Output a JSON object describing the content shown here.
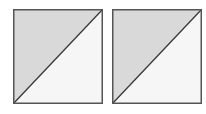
{
  "diagram": {
    "tiles": [
      {
        "name": "left-square",
        "x": 13,
        "upper_fill": "#d9d9d9",
        "lower_fill": "#f6f6f6",
        "border": "#555555"
      },
      {
        "name": "right-square",
        "x": 112,
        "upper_fill": "#d9d9d9",
        "lower_fill": "#f6f6f6",
        "border": "#555555"
      }
    ],
    "diagonal": "bottom-left to top-right",
    "diagonal_color": "#333333"
  }
}
